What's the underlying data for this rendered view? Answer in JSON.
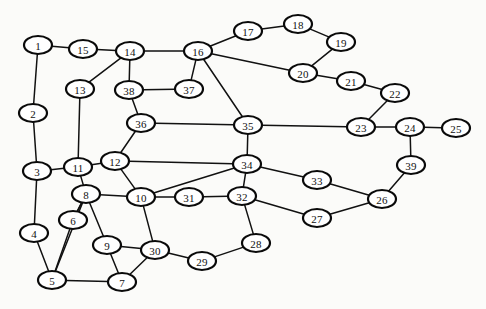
{
  "figure": {
    "type": "node-link-graph",
    "background_color": "#fbfbf9",
    "node_fill_color": "#ffffff",
    "node_stroke_color": "#0a0a0a",
    "edge_color": "#111111",
    "label_color": "#111111",
    "node_shape": "ellipse",
    "node_rx": 14,
    "node_ry": 9,
    "width": 486,
    "height": 309
  },
  "graph_data": {
    "type": "graph",
    "directed": false,
    "node_count": 39,
    "edge_count": 58,
    "nodes": [
      {
        "id": 1,
        "label": "1",
        "x": 38,
        "y": 45
      },
      {
        "id": 2,
        "label": "2",
        "x": 33,
        "y": 113
      },
      {
        "id": 3,
        "label": "3",
        "x": 37,
        "y": 171
      },
      {
        "id": 4,
        "label": "4",
        "x": 34,
        "y": 233
      },
      {
        "id": 5,
        "label": "5",
        "x": 52,
        "y": 280
      },
      {
        "id": 6,
        "label": "6",
        "x": 73,
        "y": 220
      },
      {
        "id": 7,
        "label": "7",
        "x": 122,
        "y": 282
      },
      {
        "id": 8,
        "label": "8",
        "x": 86,
        "y": 194
      },
      {
        "id": 9,
        "label": "9",
        "x": 107,
        "y": 245
      },
      {
        "id": 10,
        "label": "10",
        "x": 141,
        "y": 197
      },
      {
        "id": 11,
        "label": "11",
        "x": 78,
        "y": 167
      },
      {
        "id": 12,
        "label": "12",
        "x": 115,
        "y": 161
      },
      {
        "id": 13,
        "label": "13",
        "x": 80,
        "y": 89
      },
      {
        "id": 14,
        "label": "14",
        "x": 130,
        "y": 51
      },
      {
        "id": 15,
        "label": "15",
        "x": 83,
        "y": 49
      },
      {
        "id": 16,
        "label": "16",
        "x": 198,
        "y": 51
      },
      {
        "id": 17,
        "label": "17",
        "x": 248,
        "y": 31
      },
      {
        "id": 18,
        "label": "18",
        "x": 298,
        "y": 24
      },
      {
        "id": 19,
        "label": "19",
        "x": 341,
        "y": 42
      },
      {
        "id": 20,
        "label": "20",
        "x": 303,
        "y": 73
      },
      {
        "id": 21,
        "label": "21",
        "x": 351,
        "y": 81
      },
      {
        "id": 22,
        "label": "22",
        "x": 395,
        "y": 93
      },
      {
        "id": 23,
        "label": "23",
        "x": 361,
        "y": 127
      },
      {
        "id": 24,
        "label": "24",
        "x": 410,
        "y": 127
      },
      {
        "id": 25,
        "label": "25",
        "x": 456,
        "y": 128
      },
      {
        "id": 26,
        "label": "26",
        "x": 382,
        "y": 199
      },
      {
        "id": 27,
        "label": "27",
        "x": 317,
        "y": 218
      },
      {
        "id": 28,
        "label": "28",
        "x": 256,
        "y": 243
      },
      {
        "id": 29,
        "label": "29",
        "x": 202,
        "y": 261
      },
      {
        "id": 30,
        "label": "30",
        "x": 155,
        "y": 250
      },
      {
        "id": 31,
        "label": "31",
        "x": 189,
        "y": 197
      },
      {
        "id": 32,
        "label": "32",
        "x": 242,
        "y": 196
      },
      {
        "id": 33,
        "label": "33",
        "x": 317,
        "y": 180
      },
      {
        "id": 34,
        "label": "34",
        "x": 247,
        "y": 164
      },
      {
        "id": 35,
        "label": "35",
        "x": 248,
        "y": 125
      },
      {
        "id": 36,
        "label": "36",
        "x": 141,
        "y": 123
      },
      {
        "id": 37,
        "label": "37",
        "x": 189,
        "y": 89
      },
      {
        "id": 38,
        "label": "38",
        "x": 129,
        "y": 90
      },
      {
        "id": 39,
        "label": "39",
        "x": 411,
        "y": 165
      }
    ],
    "edges": [
      [
        1,
        15
      ],
      [
        1,
        2
      ],
      [
        2,
        3
      ],
      [
        3,
        4
      ],
      [
        3,
        11
      ],
      [
        4,
        5
      ],
      [
        5,
        6
      ],
      [
        5,
        7
      ],
      [
        6,
        8
      ],
      [
        7,
        9
      ],
      [
        7,
        30
      ],
      [
        8,
        9
      ],
      [
        8,
        10
      ],
      [
        8,
        11
      ],
      [
        8,
        6
      ],
      [
        9,
        30
      ],
      [
        10,
        12
      ],
      [
        10,
        30
      ],
      [
        10,
        31
      ],
      [
        10,
        34
      ],
      [
        11,
        12
      ],
      [
        11,
        13
      ],
      [
        12,
        34
      ],
      [
        12,
        36
      ],
      [
        13,
        14
      ],
      [
        14,
        15
      ],
      [
        14,
        16
      ],
      [
        14,
        38
      ],
      [
        16,
        17
      ],
      [
        16,
        20
      ],
      [
        16,
        35
      ],
      [
        16,
        37
      ],
      [
        17,
        18
      ],
      [
        18,
        19
      ],
      [
        19,
        20
      ],
      [
        20,
        21
      ],
      [
        21,
        22
      ],
      [
        22,
        23
      ],
      [
        23,
        24
      ],
      [
        23,
        35
      ],
      [
        24,
        25
      ],
      [
        24,
        39
      ],
      [
        26,
        27
      ],
      [
        26,
        33
      ],
      [
        26,
        39
      ],
      [
        28,
        29
      ],
      [
        28,
        32
      ],
      [
        29,
        30
      ],
      [
        31,
        32
      ],
      [
        32,
        27
      ],
      [
        32,
        34
      ],
      [
        33,
        34
      ],
      [
        34,
        35
      ],
      [
        35,
        36
      ],
      [
        36,
        38
      ],
      [
        37,
        38
      ],
      [
        8,
        5
      ]
    ]
  }
}
